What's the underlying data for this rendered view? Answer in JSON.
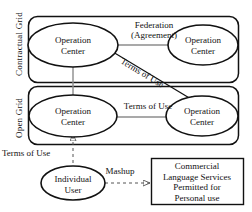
{
  "diagram": {
    "group_labels": {
      "contractual_grid": "Contractual  Grid",
      "open_grid": "Open  Grid"
    },
    "nodes": {
      "oc_top_left": {
        "line1": "Operation",
        "line2": "Center"
      },
      "oc_top_right": {
        "line1": "Operation",
        "line2": "Center"
      },
      "oc_bottom_left": {
        "line1": "Operation",
        "line2": "Center"
      },
      "oc_bottom_right": {
        "line1": "Operation",
        "line2": "Center"
      },
      "individual_user": {
        "line1": "Individual",
        "line2": "User"
      },
      "commercial_box": {
        "line1": "Commercial",
        "line2": "Language  Services",
        "line3": "Permitted for",
        "line4": "Personal use"
      }
    },
    "edge_labels": {
      "federation_line1": "Federation",
      "federation_line2": "(Agreement)",
      "terms_of_use_diagonal": "Terms of Use",
      "terms_of_use_middle": "Terms of Use",
      "terms_of_use_lower_left": "Terms of Use",
      "mashup": "Mashup"
    },
    "colors": {
      "stroke": "#111111",
      "arrow": "#777777",
      "background": "#ffffff"
    }
  }
}
